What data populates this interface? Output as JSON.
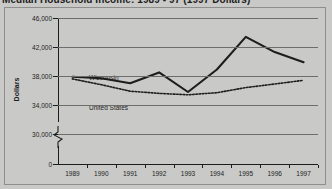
{
  "title": "Median Household Income: 1989 - 97 (1997 Dollars)",
  "frame": {
    "border_color": "#8e8e8c",
    "background": "#c9c9c7"
  },
  "axis": {
    "y_title": "Dollars",
    "y_ticks": [
      "46,000",
      "42,000",
      "38,000",
      "34,000",
      "30,000",
      "0"
    ],
    "x_ticks": [
      "1989",
      "1990",
      "1991",
      "1992",
      "1993",
      "1994",
      "1995",
      "1996",
      "1997"
    ],
    "has_axis_break": true
  },
  "labels": {
    "wisconsin": "Wisconsin",
    "united_states": "United States"
  },
  "chart_data": {
    "type": "line",
    "title": "Median Household Income: 1989 - 97 (1997 Dollars)",
    "xlabel": "",
    "ylabel": "Dollars",
    "categories": [
      "1989",
      "1990",
      "1991",
      "1992",
      "1993",
      "1994",
      "1995",
      "1996",
      "1997"
    ],
    "ylim": [
      30000,
      46000
    ],
    "yticks": [
      30000,
      34000,
      38000,
      42000,
      46000
    ],
    "grid": true,
    "legend": "inline-labels",
    "series": [
      {
        "name": "Wisconsin",
        "style": "solid",
        "color": "#1d1d1d",
        "values": [
          37900,
          37700,
          37000,
          38500,
          35800,
          38900,
          43400,
          41300,
          39900
        ]
      },
      {
        "name": "United States",
        "style": "dotted",
        "color": "#1d1d1d",
        "values": [
          37600,
          36800,
          35900,
          35600,
          35400,
          35700,
          36400,
          36900,
          37400
        ]
      }
    ]
  }
}
